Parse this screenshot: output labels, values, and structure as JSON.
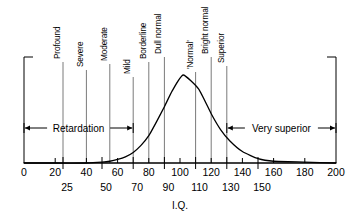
{
  "chart_data": {
    "type": "area",
    "title": "",
    "subtitle": "",
    "xlabel": "I.Q.",
    "ylabel": "",
    "xlim": [
      0,
      200
    ],
    "ylim": [
      0,
      1
    ],
    "grid": false,
    "legend_position": "none",
    "x_ticks_primary": [
      0,
      20,
      40,
      60,
      80,
      100,
      120,
      140,
      160,
      180,
      200
    ],
    "x_ticks_secondary": [
      25,
      50,
      70,
      90,
      110,
      130,
      150
    ],
    "series": [
      {
        "name": "I.Q. distribution",
        "x": [
          0,
          20,
          40,
          50,
          55,
          60,
          65,
          70,
          75,
          80,
          85,
          90,
          95,
          102,
          112,
          120,
          126,
          132,
          140,
          150,
          160,
          180,
          200
        ],
        "values": [
          0.0,
          0.0,
          0.0,
          0.01,
          0.02,
          0.04,
          0.07,
          0.12,
          0.2,
          0.31,
          0.47,
          0.64,
          0.82,
          1.0,
          0.84,
          0.56,
          0.38,
          0.25,
          0.13,
          0.05,
          0.02,
          0.01,
          0.0
        ]
      }
    ],
    "category_bands": [
      {
        "label": "Profound",
        "boundary_iq": 25
      },
      {
        "label": "Severe",
        "boundary_iq": 40
      },
      {
        "label": "Moderate",
        "boundary_iq": 55
      },
      {
        "label": "Mild",
        "boundary_iq": 70
      },
      {
        "label": "Borderline",
        "boundary_iq": 80
      },
      {
        "label": "Dull normal",
        "boundary_iq": 90
      },
      {
        "label": "'Normal'",
        "boundary_iq": 110
      },
      {
        "label": "Bright normal",
        "boundary_iq": 120
      },
      {
        "label": "Superior",
        "boundary_iq": 130
      }
    ],
    "annotations": [
      {
        "label": "Retardation",
        "from_iq": 0,
        "to_iq": 70
      },
      {
        "label": "Very superior",
        "from_iq": 130,
        "to_iq": 200
      }
    ],
    "colors": {
      "curve": "#000000",
      "axis": "#000000",
      "divider": "#7a7a7a",
      "background": "#ffffff",
      "text": "#000000"
    }
  }
}
